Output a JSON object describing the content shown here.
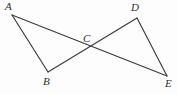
{
  "figure": {
    "type": "geometry-diagram",
    "width": 177,
    "height": 95,
    "background_color": "#fdfdfd",
    "stroke_color": "#3a3a3a",
    "label_color": "#2e2e2e"
  },
  "points": [
    {
      "id": "A",
      "label": "A",
      "x": 12,
      "y": 15,
      "label_x": 5,
      "label_y": 1
    },
    {
      "id": "B",
      "label": "B",
      "x": 48,
      "y": 72,
      "label_x": 43,
      "label_y": 76
    },
    {
      "id": "C",
      "label": "C",
      "x": 90,
      "y": 49,
      "label_x": 83,
      "label_y": 33
    },
    {
      "id": "D",
      "label": "D",
      "x": 137,
      "y": 18,
      "label_x": 131,
      "label_y": 2
    },
    {
      "id": "E",
      "label": "E",
      "x": 167,
      "y": 76,
      "label_x": 165,
      "label_y": 78
    }
  ],
  "segments": [
    {
      "id": "AB",
      "from": "A",
      "to": "B",
      "x1": 12,
      "y1": 15,
      "x2": 48,
      "y2": 72
    },
    {
      "id": "AE",
      "from": "A",
      "to": "E",
      "x1": 12,
      "y1": 15,
      "x2": 167,
      "y2": 76
    },
    {
      "id": "BD",
      "from": "B",
      "to": "D",
      "x1": 48,
      "y1": 72,
      "x2": 137,
      "y2": 18
    },
    {
      "id": "DE",
      "from": "D",
      "to": "E",
      "x1": 137,
      "y1": 18,
      "x2": 167,
      "y2": 76
    }
  ]
}
